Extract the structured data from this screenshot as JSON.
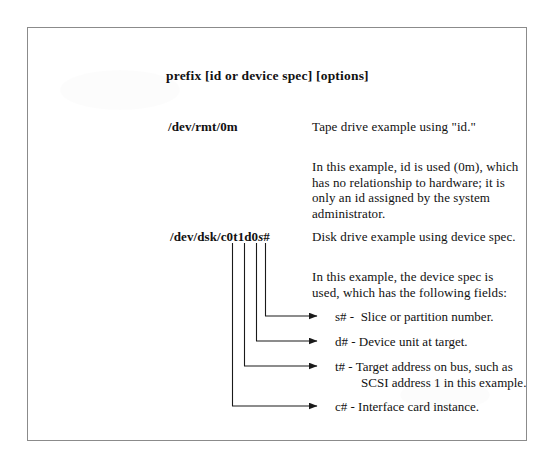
{
  "document": {
    "title_line": "prefix [id or device spec] [options]"
  },
  "examples": [
    {
      "spec": "/dev/rmt/0m",
      "caption": "Tape drive example using \"id.\"",
      "explanation": "In this example, id is used (0m), which\nhas no relationship to hardware; it is\nonly an id assigned by the system\nadministrator."
    },
    {
      "spec_prefix": "/dev/dsk/c0t1d0",
      "spec_italic": "s",
      "spec_suffix": "#",
      "spec_full": "/dev/dsk/c0t1d0s#",
      "caption": "Disk drive example using device spec.",
      "explanation": "In this example, the device spec is\nused, which has the following fields:"
    }
  ],
  "fields": [
    {
      "key": "s#",
      "text": "s# -  Slice or partition number."
    },
    {
      "key": "d#",
      "text": "d# - Device unit at target."
    },
    {
      "key": "t#",
      "text": "t# - Target address on bus, such as\n        SCSI address 1 in this example."
    },
    {
      "key": "c#",
      "text": "c# - Interface card instance."
    }
  ],
  "colors": {
    "ink": "#111111",
    "border": "#8b8b8b",
    "paper": "#ffffff",
    "leader": "#1a1a1a"
  }
}
